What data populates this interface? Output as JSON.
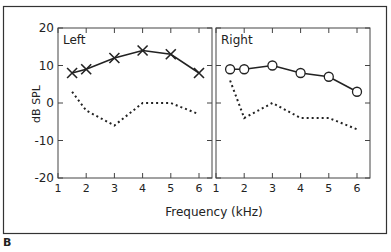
{
  "figure": {
    "panel_label": "B",
    "ylabel": "dB SPL",
    "xlabel": "Frequency (kHz)"
  },
  "chart_data": [
    {
      "type": "line",
      "title": "Left",
      "xlabel": "Frequency (kHz)",
      "ylabel": "dB SPL",
      "xlim": [
        1,
        6.5
      ],
      "ylim": [
        -20,
        20
      ],
      "xticks": [
        1,
        2,
        3,
        4,
        5,
        6
      ],
      "yticks": [
        -20,
        -10,
        0,
        10,
        20
      ],
      "grid": false,
      "series": [
        {
          "name": "Measured",
          "style": "solid",
          "marker": "x",
          "x": [
            1.5,
            2,
            3,
            4,
            5,
            6
          ],
          "values": [
            8,
            9,
            12,
            14,
            13,
            8
          ]
        },
        {
          "name": "Noise floor",
          "style": "dotted",
          "marker": "none",
          "x": [
            1.5,
            2,
            3,
            4,
            5,
            6
          ],
          "values": [
            3,
            -2,
            -6,
            0,
            0,
            -3
          ]
        }
      ]
    },
    {
      "type": "line",
      "title": "Right",
      "xlabel": "Frequency (kHz)",
      "ylabel": "dB SPL",
      "xlim": [
        1,
        6.5
      ],
      "ylim": [
        -20,
        20
      ],
      "xticks": [
        1,
        2,
        3,
        4,
        5,
        6
      ],
      "yticks": [
        -20,
        -10,
        0,
        10,
        20
      ],
      "grid": false,
      "series": [
        {
          "name": "Measured",
          "style": "solid",
          "marker": "circle",
          "x": [
            1.5,
            2,
            3,
            4,
            5,
            6
          ],
          "values": [
            9,
            9,
            10,
            8,
            7,
            3
          ]
        },
        {
          "name": "Noise floor",
          "style": "dotted",
          "marker": "none",
          "x": [
            1.5,
            2,
            3,
            4,
            5,
            6
          ],
          "values": [
            6,
            -4,
            0,
            -4,
            -4,
            -7
          ]
        }
      ]
    }
  ]
}
